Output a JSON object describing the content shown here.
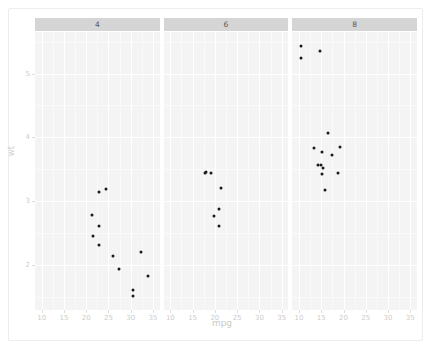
{
  "chart_data": {
    "type": "scatter",
    "title": "",
    "xlabel": "mpg",
    "ylabel": "wt",
    "xlim": [
      8.5,
      36.5
    ],
    "ylim": [
      1.3,
      5.65
    ],
    "xticks": [
      10,
      15,
      20,
      25,
      30,
      35
    ],
    "yticks": [
      2,
      3,
      4,
      5
    ],
    "xtick_labels": [
      "10",
      "15",
      "20",
      "25",
      "30",
      "35"
    ],
    "ytick_labels": [
      "2",
      "3",
      "4",
      "5"
    ],
    "grid": true,
    "legend": "none",
    "facet_variable": "cyl",
    "facet_type": "facet_wrap-columns",
    "panels": [
      {
        "label": "4",
        "points": [
          {
            "x": 22.8,
            "y": 2.32
          },
          {
            "x": 24.4,
            "y": 3.19
          },
          {
            "x": 22.8,
            "y": 3.15
          },
          {
            "x": 32.4,
            "y": 2.2
          },
          {
            "x": 30.4,
            "y": 1.615
          },
          {
            "x": 33.9,
            "y": 1.835
          },
          {
            "x": 21.5,
            "y": 2.465
          },
          {
            "x": 27.3,
            "y": 1.935
          },
          {
            "x": 26.0,
            "y": 2.14
          },
          {
            "x": 30.4,
            "y": 1.513
          },
          {
            "x": 21.4,
            "y": 2.78
          },
          {
            "x": 22.8,
            "y": 2.62
          }
        ]
      },
      {
        "label": "6",
        "points": [
          {
            "x": 21.0,
            "y": 2.62
          },
          {
            "x": 21.0,
            "y": 2.875
          },
          {
            "x": 21.4,
            "y": 3.215
          },
          {
            "x": 18.1,
            "y": 3.46
          },
          {
            "x": 19.2,
            "y": 3.44
          },
          {
            "x": 17.8,
            "y": 3.44
          },
          {
            "x": 19.7,
            "y": 2.77
          }
        ]
      },
      {
        "label": "8",
        "points": [
          {
            "x": 18.7,
            "y": 3.44
          },
          {
            "x": 14.3,
            "y": 3.57
          },
          {
            "x": 16.4,
            "y": 4.07
          },
          {
            "x": 17.3,
            "y": 3.73
          },
          {
            "x": 15.2,
            "y": 3.78
          },
          {
            "x": 10.4,
            "y": 5.25
          },
          {
            "x": 10.4,
            "y": 5.424
          },
          {
            "x": 14.7,
            "y": 5.345
          },
          {
            "x": 15.5,
            "y": 3.52
          },
          {
            "x": 15.2,
            "y": 3.435
          },
          {
            "x": 13.3,
            "y": 3.84
          },
          {
            "x": 19.2,
            "y": 3.845
          },
          {
            "x": 15.8,
            "y": 3.17
          },
          {
            "x": 15.0,
            "y": 3.57
          }
        ]
      }
    ]
  },
  "axes": {
    "x_title": "mpg",
    "y_title": "wt"
  },
  "strips": {
    "labels": [
      "4",
      "6",
      "8"
    ]
  },
  "colors": {
    "panel_background": "#f4f4f4",
    "strip_background": "#d5d5d5",
    "gridline_major": "#ffffff",
    "point_color": "#1a1a1a",
    "axis_text": "#cccccc",
    "strip_text": "#585858"
  }
}
